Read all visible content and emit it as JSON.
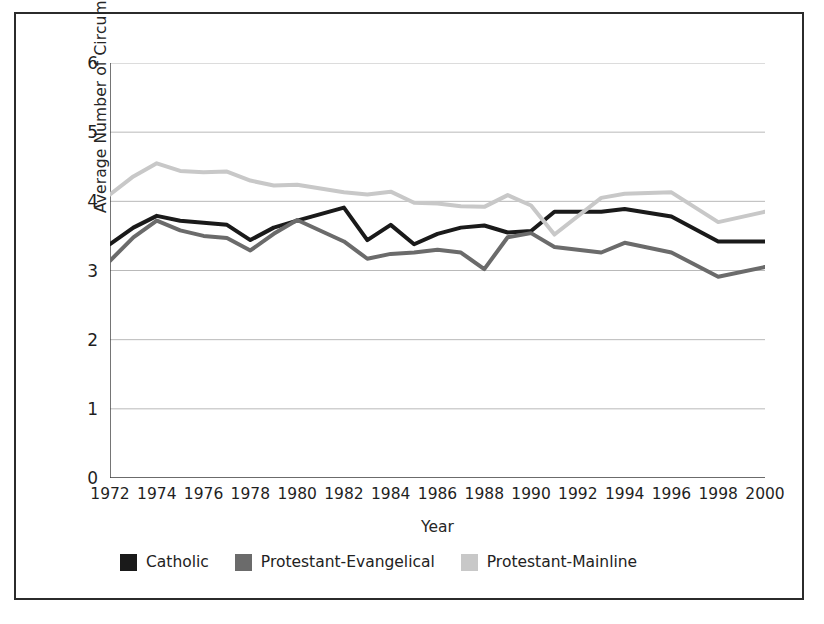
{
  "chart_data": {
    "type": "line",
    "title": "",
    "xlabel": "Year",
    "ylabel": "Average Number of Circumstances Legal",
    "xlim": [
      1972,
      2000
    ],
    "ylim": [
      0,
      6
    ],
    "yticks": [
      0,
      1,
      2,
      3,
      4,
      5,
      6
    ],
    "grid": true,
    "legend_position": "bottom-left",
    "x": [
      1972,
      1973,
      1974,
      1975,
      1976,
      1977,
      1978,
      1979,
      1980,
      1982,
      1983,
      1984,
      1985,
      1986,
      1987,
      1988,
      1989,
      1990,
      1991,
      1993,
      1994,
      1996,
      1998,
      2000
    ],
    "series": [
      {
        "name": "Catholic",
        "color": "#1a1a1a",
        "values": [
          3.38,
          3.62,
          3.79,
          3.72,
          3.69,
          3.66,
          3.44,
          3.62,
          3.72,
          3.91,
          3.44,
          3.66,
          3.38,
          3.53,
          3.62,
          3.65,
          3.55,
          3.57,
          3.85,
          3.85,
          3.89,
          3.78,
          3.42,
          3.42
        ]
      },
      {
        "name": "Protestant-Evangelical",
        "color": "#6b6b6b",
        "values": [
          3.14,
          3.48,
          3.72,
          3.58,
          3.5,
          3.47,
          3.29,
          3.53,
          3.73,
          3.42,
          3.17,
          3.24,
          3.26,
          3.3,
          3.26,
          3.02,
          3.48,
          3.54,
          3.34,
          3.26,
          3.4,
          3.26,
          2.91,
          3.05
        ]
      },
      {
        "name": "Protestant-Mainline",
        "color": "#c8c8c8",
        "values": [
          4.1,
          4.36,
          4.55,
          4.44,
          4.42,
          4.43,
          4.3,
          4.23,
          4.24,
          4.13,
          4.1,
          4.14,
          3.98,
          3.97,
          3.93,
          3.92,
          4.09,
          3.94,
          3.52,
          4.05,
          4.11,
          4.13,
          3.7,
          3.85
        ]
      }
    ]
  },
  "axis": {
    "y_title": "Average Number of Circumstances Legal",
    "x_title": "Year",
    "y_ticks": [
      "6",
      "5",
      "4",
      "3",
      "2",
      "1",
      "0"
    ],
    "x_ticks": [
      "1972",
      "1974",
      "1976",
      "1978",
      "1980",
      "1982",
      "1984",
      "1986",
      "1988",
      "1990",
      "1992",
      "1994",
      "1996",
      "1998",
      "2000"
    ]
  },
  "legend": {
    "items": [
      {
        "label": "Catholic",
        "color": "#1a1a1a"
      },
      {
        "label": "Protestant-Evangelical",
        "color": "#6b6b6b"
      },
      {
        "label": "Protestant-Mainline",
        "color": "#c8c8c8"
      }
    ]
  }
}
